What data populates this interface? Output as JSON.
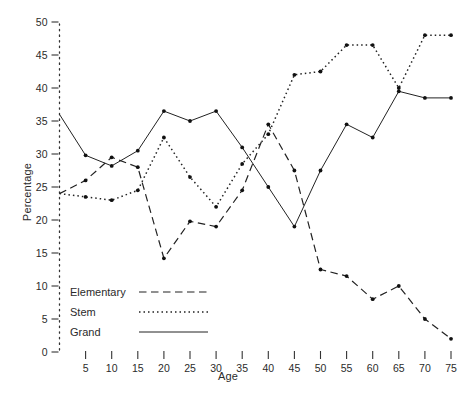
{
  "chart_data": {
    "type": "line",
    "title": "",
    "xlabel": "Age",
    "ylabel": "Percentage",
    "xlim": [
      0,
      78
    ],
    "ylim": [
      0,
      50
    ],
    "x": [
      0,
      5,
      10,
      15,
      20,
      25,
      30,
      35,
      40,
      45,
      50,
      55,
      60,
      65,
      70,
      75
    ],
    "xticks": [
      "5",
      "10",
      "15",
      "20",
      "25",
      "30",
      "35",
      "40",
      "45",
      "50",
      "55",
      "60",
      "65",
      "70",
      "75"
    ],
    "yticks": [
      "0",
      "5",
      "10",
      "15",
      "20",
      "25",
      "30",
      "35",
      "40",
      "45",
      "50"
    ],
    "grid": false,
    "legend_position": "lower-left",
    "series": [
      {
        "name": "Elementary",
        "style": "dashed",
        "values": [
          24.0,
          26.0,
          29.5,
          28.0,
          14.2,
          19.8,
          19.0,
          24.5,
          34.5,
          27.5,
          12.5,
          11.5,
          8.0,
          10.0,
          5.0,
          2.0
        ]
      },
      {
        "name": "Stem",
        "style": "dotted",
        "values": [
          24.0,
          23.5,
          23.0,
          24.5,
          32.5,
          26.5,
          22.0,
          28.5,
          33.0,
          42.0,
          42.5,
          46.5,
          46.5,
          40.0,
          48.0,
          48.0
        ]
      },
      {
        "name": "Grand",
        "style": "solid",
        "values": [
          36.0,
          29.8,
          28.2,
          30.5,
          36.5,
          35.0,
          36.5,
          31.0,
          25.0,
          19.0,
          27.5,
          34.5,
          32.5,
          39.5,
          38.5,
          38.5
        ]
      }
    ]
  },
  "legend": {
    "items": [
      {
        "label": "Elementary",
        "style": "dashed"
      },
      {
        "label": "Stem",
        "style": "dotted"
      },
      {
        "label": "Grand",
        "style": "solid"
      }
    ]
  },
  "axes": {
    "x_title": "Age",
    "y_title": "Percentage"
  },
  "caption": ""
}
